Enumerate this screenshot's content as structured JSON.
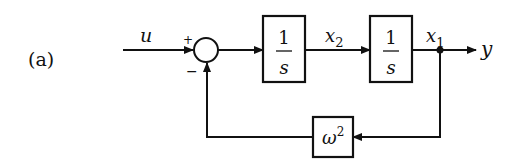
{
  "figure": {
    "panel_label": "(a)",
    "input_signal": "u",
    "output_signal": "y",
    "summing_junction": {
      "plus_sign": "+",
      "minus_sign": "−"
    },
    "blocks": [
      {
        "id": "integrator-1",
        "numerator": "1",
        "denominator": "s"
      },
      {
        "id": "integrator-2",
        "numerator": "1",
        "denominator": "s"
      }
    ],
    "state_labels": {
      "x2": {
        "base": "x",
        "sub": "2"
      },
      "x1": {
        "base": "x",
        "sub": "1"
      }
    },
    "feedback_block": {
      "base": "ω",
      "sup": "2"
    },
    "colors": {
      "line": "#111111",
      "background": "#ffffff"
    }
  }
}
